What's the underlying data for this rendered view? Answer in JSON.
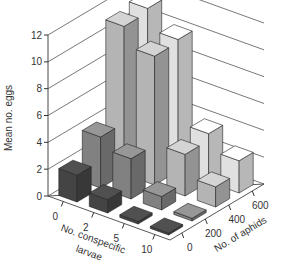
{
  "chart_data": {
    "type": "bar3d",
    "title": "",
    "ylabel": "Mean no. eggs",
    "xlabel": "No. conspecific larvae",
    "xlabel_lines": [
      "No. conspecific",
      "larvae"
    ],
    "zlabel": "No. of aphids",
    "ylim": [
      0,
      12
    ],
    "yticks": [
      "0",
      "2",
      "4",
      "6",
      "8",
      "10",
      "12"
    ],
    "x_categories": [
      "0",
      "2",
      "5",
      "10"
    ],
    "z_categories": [
      "0",
      "200",
      "400",
      "600"
    ],
    "grid": true,
    "series": [
      {
        "name": "0 aphids",
        "color": "#4a4a4a",
        "values": [
          2.0,
          1.0,
          0.2,
          0.15
        ]
      },
      {
        "name": "200 aphids",
        "color": "#8c8c8c",
        "values": [
          3.8,
          3.0,
          1.0,
          0.2
        ]
      },
      {
        "name": "400 aphids",
        "color": "#c4c4c4",
        "values": [
          11.0,
          9.6,
          3.1,
          1.5
        ]
      },
      {
        "name": "600 aphids",
        "color": "#f4f4f4",
        "values": [
          11.3,
          9.8,
          3.6,
          2.4
        ]
      }
    ]
  }
}
